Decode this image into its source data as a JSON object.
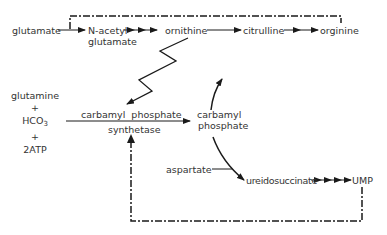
{
  "diagram": {
    "type": "metabolic-pathway",
    "top_pathway": {
      "nodes": [
        "glutamate",
        "N-acetyl",
        "glutamate",
        "ornithine",
        "citrulline",
        "orginine"
      ]
    },
    "left_inputs": {
      "glutamine": "glutamine",
      "plus1": "+",
      "hco3_base": "HCO",
      "hco3_sub": "3",
      "plus2": "+",
      "atp": "2ATP"
    },
    "enzyme": {
      "line1": "carbamyl  phosphate",
      "line2": "synthetase"
    },
    "product": {
      "line1": "carbamyl",
      "line2": "phosphate"
    },
    "bottom_pathway": {
      "aspartate": "aspartate",
      "ureidosuccinate": "ureidosuccinate",
      "ump": "UMP"
    },
    "colors": {
      "line": "#1a1a1a",
      "text": "#333333",
      "background": "#ffffff"
    }
  }
}
